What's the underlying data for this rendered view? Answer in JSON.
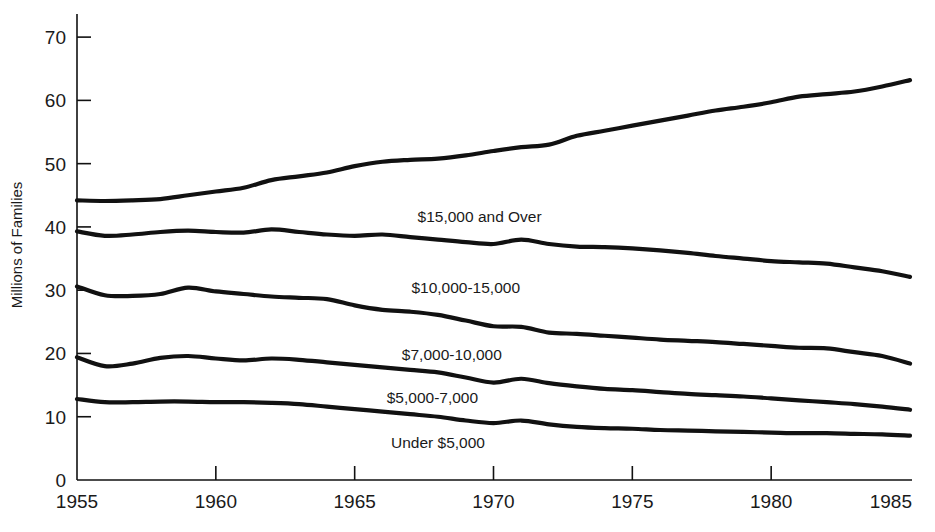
{
  "chart_data": {
    "type": "line",
    "title": "",
    "xlabel": "",
    "ylabel": "Millions of Families",
    "xlim": [
      1955,
      1985
    ],
    "ylim": [
      0,
      74
    ],
    "grid": false,
    "legend_position": "inline-annotations",
    "xticks": [
      1955,
      1960,
      1965,
      1970,
      1975,
      1980,
      1985
    ],
    "yticks": [
      0,
      10,
      20,
      30,
      40,
      50,
      60,
      70
    ],
    "x": [
      1955,
      1956,
      1957,
      1958,
      1959,
      1960,
      1961,
      1962,
      1963,
      1964,
      1965,
      1966,
      1967,
      1968,
      1969,
      1970,
      1971,
      1972,
      1973,
      1974,
      1975,
      1976,
      1977,
      1978,
      1979,
      1980,
      1981,
      1982,
      1983,
      1984,
      1985
    ],
    "series": [
      {
        "name": "$15,000 and Over",
        "values": [
          44.2,
          44.1,
          44.2,
          44.4,
          45.0,
          45.6,
          46.2,
          47.4,
          48.0,
          48.6,
          49.6,
          50.3,
          50.6,
          50.8,
          51.3,
          52.0,
          52.6,
          53.0,
          54.4,
          55.2,
          56.0,
          56.8,
          57.6,
          58.4,
          59.0,
          59.7,
          60.6,
          61.0,
          61.4,
          62.2,
          63.2
        ],
        "label_x": 1969.5,
        "label_y": 40.8
      },
      {
        "name": "$10,000-15,000",
        "values": [
          39.3,
          38.6,
          38.8,
          39.2,
          39.4,
          39.2,
          39.1,
          39.6,
          39.2,
          38.8,
          38.6,
          38.8,
          38.4,
          38.0,
          37.6,
          37.3,
          38.0,
          37.3,
          36.9,
          36.8,
          36.6,
          36.3,
          35.9,
          35.4,
          35.0,
          34.6,
          34.4,
          34.2,
          33.6,
          33.0,
          32.1
        ],
        "label_x": 1969.0,
        "label_y": 29.6
      },
      {
        "name": "$7,000-10,000",
        "values": [
          30.6,
          29.2,
          29.1,
          29.4,
          30.4,
          29.8,
          29.4,
          29.0,
          28.8,
          28.6,
          27.6,
          26.9,
          26.6,
          26.1,
          25.2,
          24.3,
          24.2,
          23.3,
          23.1,
          22.8,
          22.5,
          22.2,
          22.0,
          21.8,
          21.5,
          21.2,
          20.9,
          20.8,
          20.2,
          19.6,
          18.4
        ],
        "label_x": 1968.5,
        "label_y": 18.9
      },
      {
        "name": "$5,000-7,000",
        "values": [
          19.4,
          18.0,
          18.4,
          19.3,
          19.6,
          19.2,
          18.9,
          19.2,
          19.0,
          18.6,
          18.2,
          17.8,
          17.4,
          17.0,
          16.2,
          15.4,
          16.0,
          15.3,
          14.8,
          14.4,
          14.2,
          13.9,
          13.6,
          13.4,
          13.2,
          12.9,
          12.6,
          12.3,
          12.0,
          11.6,
          11.1
        ],
        "label_x": 1967.8,
        "label_y": 12.2
      },
      {
        "name": "Under $5,000",
        "values": [
          12.8,
          12.3,
          12.3,
          12.4,
          12.4,
          12.3,
          12.3,
          12.2,
          12.0,
          11.6,
          11.2,
          10.8,
          10.4,
          10.0,
          9.4,
          9.0,
          9.4,
          8.8,
          8.4,
          8.2,
          8.1,
          7.9,
          7.8,
          7.7,
          7.6,
          7.5,
          7.4,
          7.4,
          7.3,
          7.2,
          7.0
        ],
        "label_x": 1968.0,
        "label_y": 5.0
      }
    ]
  },
  "colors": {
    "line": "#111111",
    "axis": "#111111",
    "background": "#ffffff",
    "text": "#1a1a1a"
  }
}
